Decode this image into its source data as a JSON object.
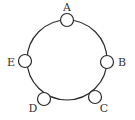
{
  "diagram": {
    "type": "circular-arrangement",
    "ring": {
      "cx": 67,
      "cy": 60,
      "r": 40
    },
    "node_radius": 6.5,
    "nodes": [
      {
        "id": "A",
        "label": "A",
        "x": 67,
        "y": 20,
        "lx": 67,
        "ly": 11
      },
      {
        "id": "B",
        "label": "B",
        "x": 107,
        "y": 62,
        "lx": 122,
        "ly": 66
      },
      {
        "id": "C",
        "label": "C",
        "x": 95,
        "y": 97,
        "lx": 104,
        "ly": 112
      },
      {
        "id": "D",
        "label": "D",
        "x": 44,
        "y": 99,
        "lx": 33,
        "ly": 112
      },
      {
        "id": "E",
        "label": "E",
        "x": 25,
        "y": 61,
        "lx": 11,
        "ly": 66
      }
    ]
  }
}
